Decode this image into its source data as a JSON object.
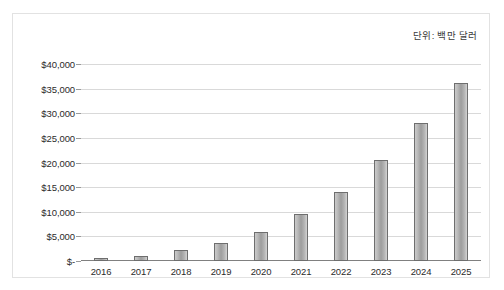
{
  "annotation": {
    "unit_note": "단위: 백만 달러"
  },
  "chart_data": {
    "type": "bar",
    "title": "",
    "subtitle": "",
    "xlabel": "",
    "ylabel": "",
    "unit_note": "단위: 백만 달러",
    "categories": [
      "2016",
      "2017",
      "2018",
      "2019",
      "2020",
      "2021",
      "2022",
      "2023",
      "2024",
      "2025"
    ],
    "values": [
      600,
      1000,
      2300,
      3600,
      5800,
      9500,
      14000,
      20500,
      28000,
      36200
    ],
    "ylim": [
      0,
      40000
    ],
    "ytick_values": [
      40000,
      35000,
      30000,
      25000,
      20000,
      15000,
      10000,
      5000,
      0
    ],
    "ytick_labels": [
      "$40,000",
      "$35,000",
      "$30,000",
      "$25,000",
      "$20,000",
      "$15,000",
      "$10,000",
      "$5,000",
      "$-"
    ],
    "grid": true,
    "legend": false,
    "legend_position": "none",
    "bar_color": "#9d9d9d",
    "bar_border_color": "#6e6e6e",
    "grid_color": "#d9d9d9",
    "axis_color": "#808080",
    "frame_color": "#e2e2e2",
    "text_color": "#2b2b2b"
  }
}
